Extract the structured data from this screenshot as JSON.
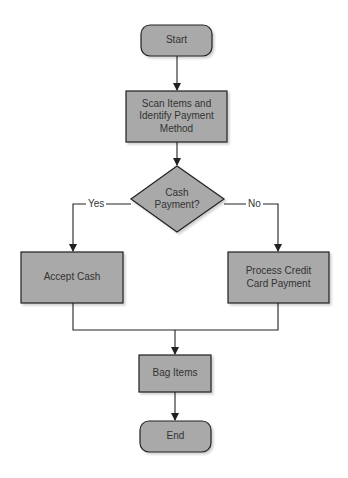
{
  "diagram": {
    "type": "flowchart",
    "colors": {
      "node_fill": "#a9a9a9",
      "stroke": "#222222",
      "text": "#333333",
      "background": "#ffffff"
    },
    "nodes": {
      "start": {
        "label": "Start",
        "shape": "rounded-rect"
      },
      "scan": {
        "label": "Scan Items and Identify Payment Method",
        "shape": "rect"
      },
      "decision": {
        "label": "Cash Payment?",
        "shape": "diamond"
      },
      "accept_cash": {
        "label": "Accept Cash",
        "shape": "rect"
      },
      "process_credit": {
        "label": "Process Credit Card Payment",
        "shape": "rect"
      },
      "bag": {
        "label": "Bag Items",
        "shape": "rect"
      },
      "end": {
        "label": "End",
        "shape": "rounded-rect"
      }
    },
    "edges": [
      {
        "from": "start",
        "to": "scan",
        "label": ""
      },
      {
        "from": "scan",
        "to": "decision",
        "label": ""
      },
      {
        "from": "decision",
        "to": "accept_cash",
        "label": "Yes"
      },
      {
        "from": "decision",
        "to": "process_credit",
        "label": "No"
      },
      {
        "from": "accept_cash",
        "to": "bag",
        "label": ""
      },
      {
        "from": "process_credit",
        "to": "bag",
        "label": ""
      },
      {
        "from": "bag",
        "to": "end",
        "label": ""
      }
    ],
    "edge_labels": {
      "yes": "Yes",
      "no": "No"
    }
  }
}
